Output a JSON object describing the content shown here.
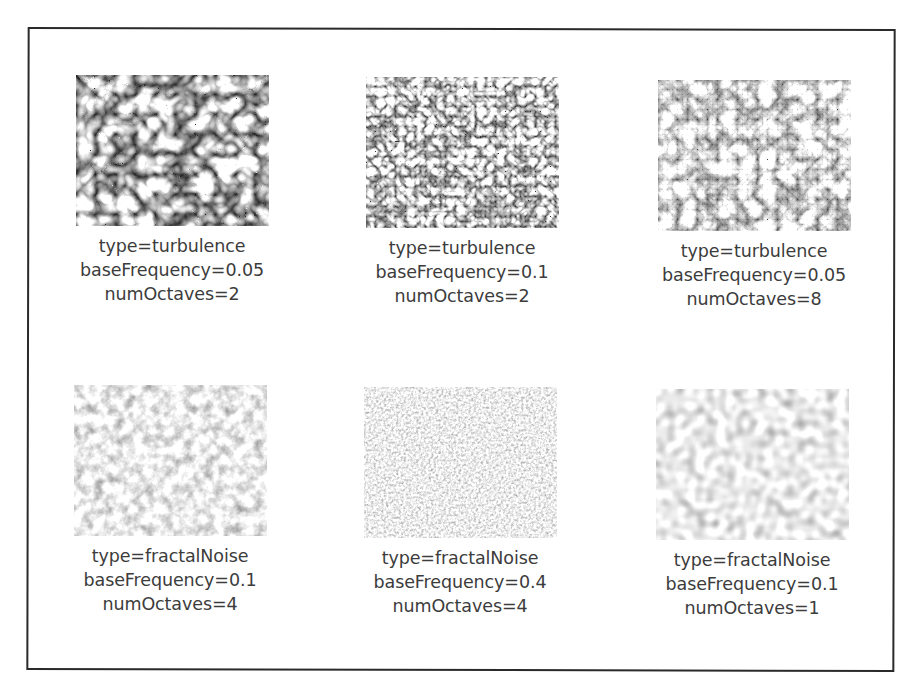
{
  "figure": {
    "panels": [
      {
        "type_label": "type=turbulence",
        "freq_label": "baseFrequency=0.05",
        "oct_label": "numOctaves=2",
        "type": "turbulence",
        "baseFrequency": 0.05,
        "numOctaves": 2
      },
      {
        "type_label": "type=turbulence",
        "freq_label": "baseFrequency=0.1",
        "oct_label": "numOctaves=2",
        "type": "turbulence",
        "baseFrequency": 0.1,
        "numOctaves": 2
      },
      {
        "type_label": "type=turbulence",
        "freq_label": "baseFrequency=0.05",
        "oct_label": "numOctaves=8",
        "type": "turbulence",
        "baseFrequency": 0.05,
        "numOctaves": 8
      },
      {
        "type_label": "type=fractalNoise",
        "freq_label": "baseFrequency=0.1",
        "oct_label": "numOctaves=4",
        "type": "fractalNoise",
        "baseFrequency": 0.1,
        "numOctaves": 4
      },
      {
        "type_label": "type=fractalNoise",
        "freq_label": "baseFrequency=0.4",
        "oct_label": "numOctaves=4",
        "type": "fractalNoise",
        "baseFrequency": 0.4,
        "numOctaves": 4
      },
      {
        "type_label": "type=fractalNoise",
        "freq_label": "baseFrequency=0.1",
        "oct_label": "numOctaves=1",
        "type": "fractalNoise",
        "baseFrequency": 0.1,
        "numOctaves": 1
      }
    ],
    "colors": {
      "border": "#2a2a2a",
      "text": "#3c3c3c",
      "background": "#ffffff"
    }
  }
}
